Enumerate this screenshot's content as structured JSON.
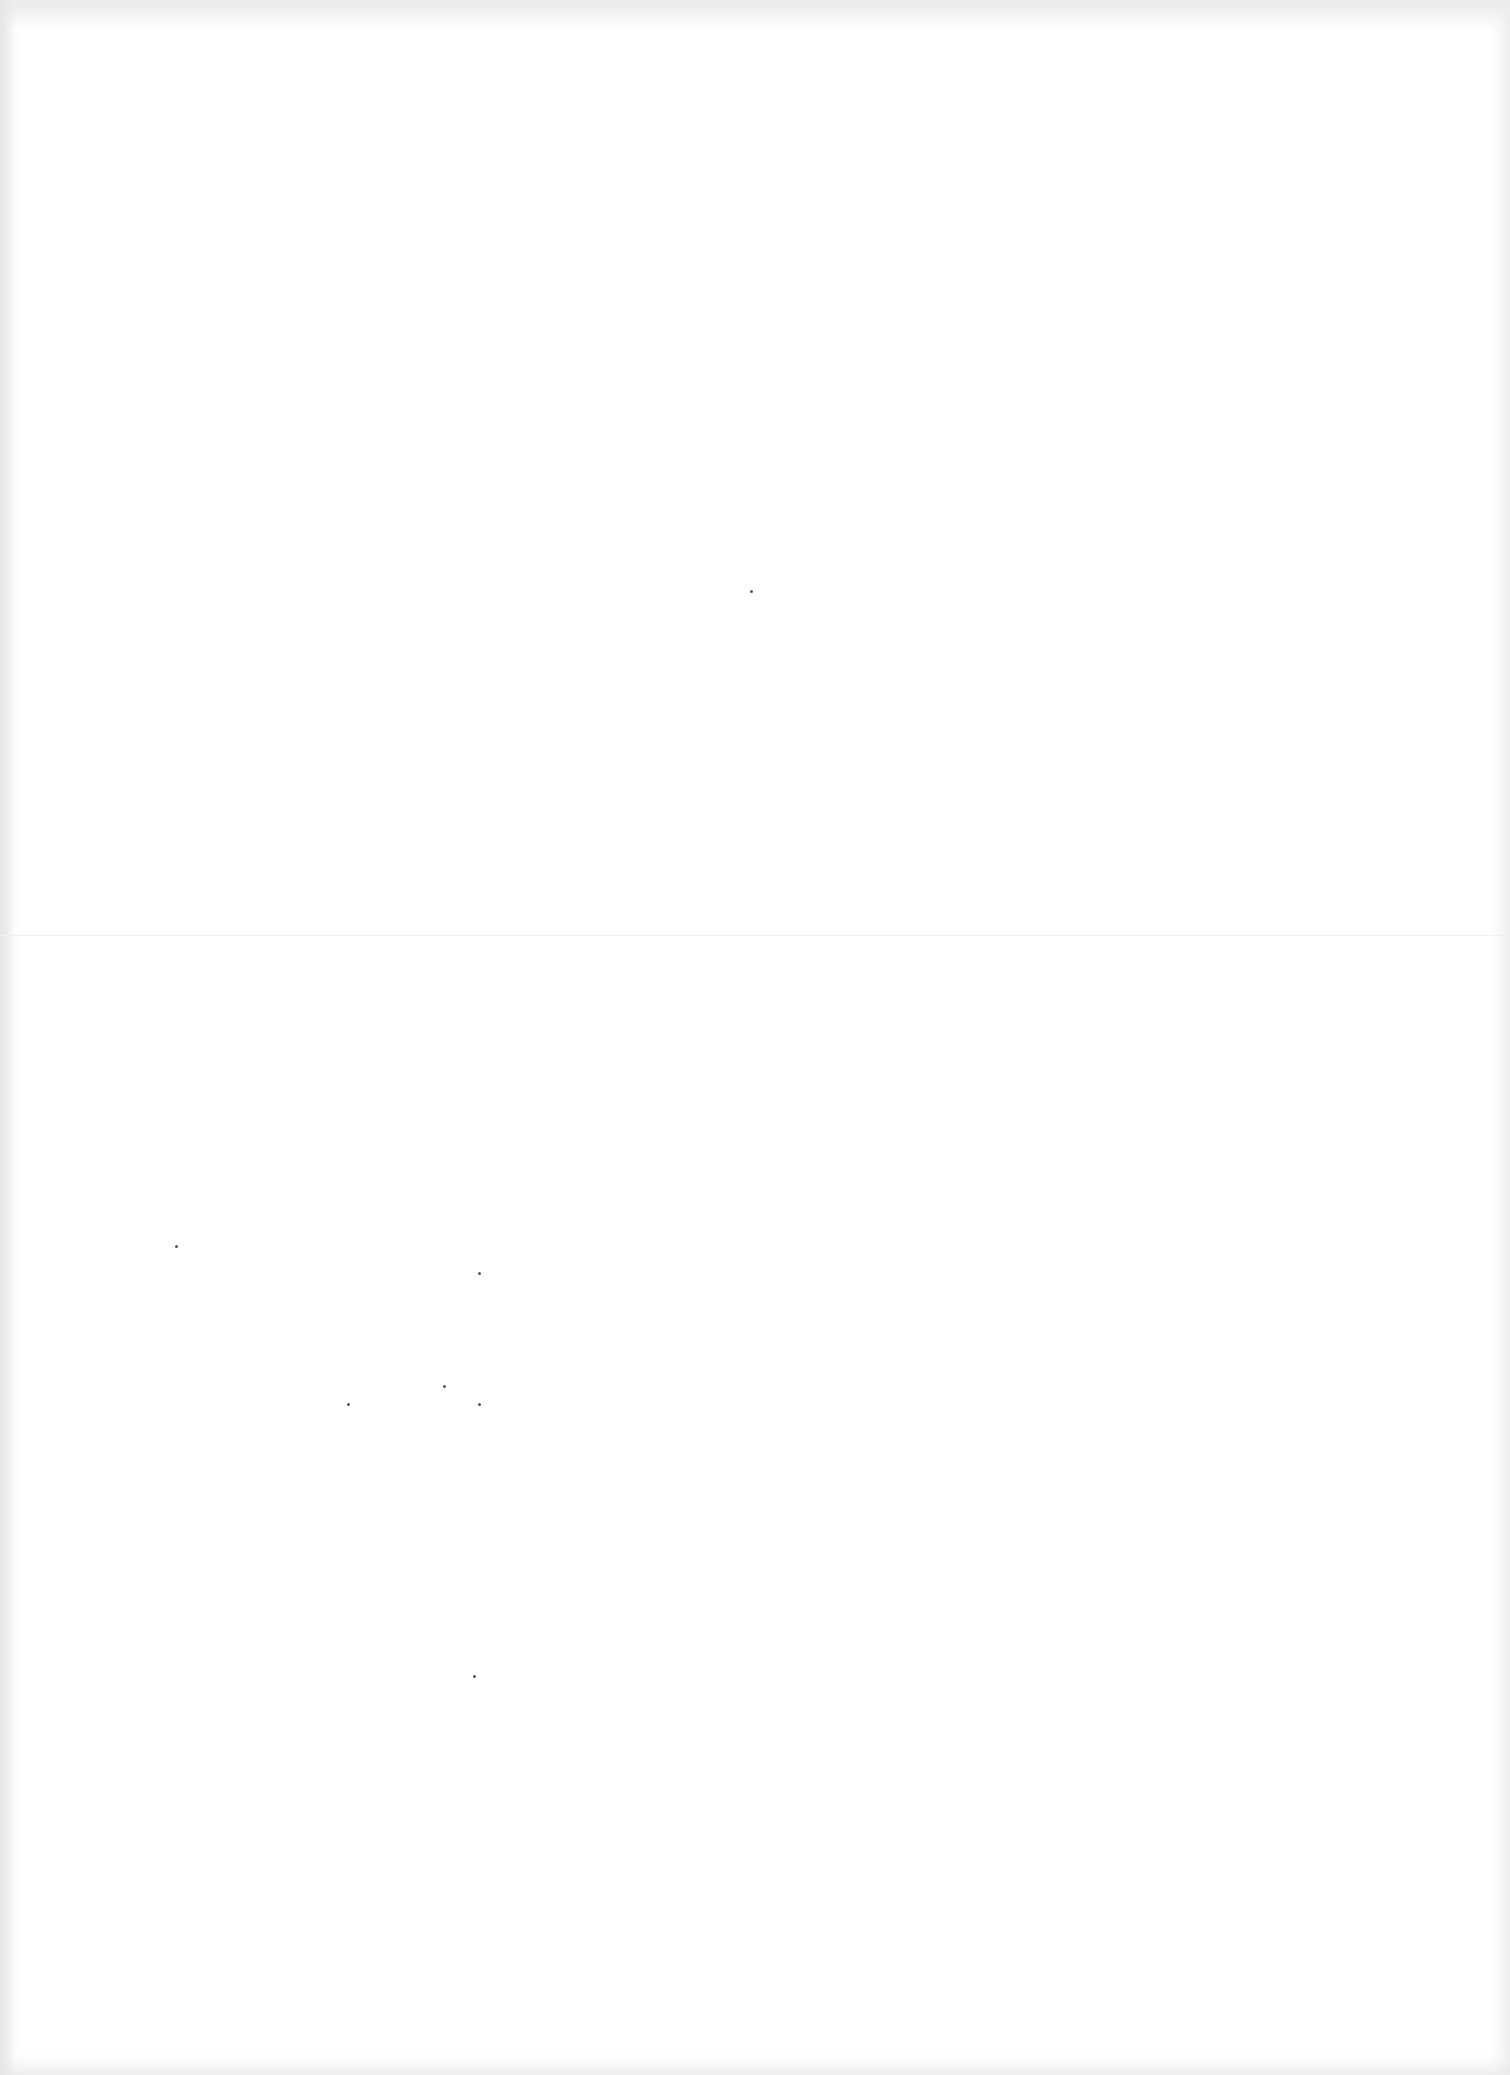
{
  "document": {
    "type": "blank scanned page",
    "visible_text": [],
    "features": {
      "fold_line_y": 935,
      "bleed_through_regions": [
        {
          "x": 150,
          "y": 1240,
          "w": 360,
          "h": 230
        },
        {
          "x": 300,
          "y": 1600,
          "w": 340,
          "h": 80
        }
      ]
    },
    "colors": {
      "paper": "#ffffff",
      "edge_shade": "#e9e9e9",
      "speck": "#555555"
    }
  }
}
